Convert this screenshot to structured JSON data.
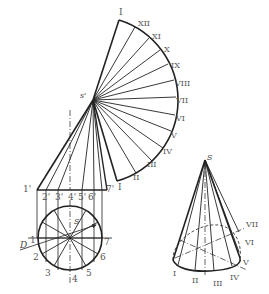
{
  "diagram": {
    "stroke_color": "#222222",
    "label_color": "#555555",
    "development": {
      "apex_label": "s'",
      "generatrix_labels": [
        "I",
        "XII",
        "XI",
        "X",
        "IX",
        "VIII",
        "VII",
        "VI",
        "V",
        "IV",
        "III",
        "II",
        "I"
      ]
    },
    "front_view": {
      "base_labels": [
        "1'",
        "2'",
        "3'",
        "4'",
        "5'",
        "6'",
        "7'"
      ]
    },
    "top_view": {
      "center_label": "S",
      "point_labels": [
        "1",
        "2",
        "3",
        "4",
        "5",
        "6",
        "7"
      ],
      "diameter_label": "D"
    },
    "axonometric": {
      "apex_label": "S",
      "point_labels": [
        "I",
        "II",
        "III",
        "IV",
        "V",
        "VI",
        "VII"
      ]
    }
  }
}
